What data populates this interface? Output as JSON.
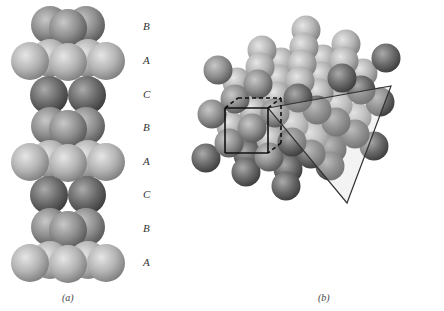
{
  "figure": {
    "panel_a": {
      "caption": "(a)",
      "layer_labels": [
        "B",
        "A",
        "C",
        "B",
        "A",
        "C",
        "B",
        "A"
      ],
      "layer_label_y": [
        27,
        61,
        95,
        128,
        162,
        195,
        229,
        263
      ],
      "label_x": 143
    },
    "panel_b": {
      "caption": "(b)",
      "unit_cell": {
        "front": [
          225,
          108,
          268,
          153
        ],
        "back_offset": [
          13,
          -10
        ]
      },
      "close_packed_plane_triangle": [
        [
          268,
          108
        ],
        [
          391,
          86
        ],
        [
          347,
          203
        ]
      ]
    },
    "colors": {
      "sphere_light": "#d4d4d4",
      "sphere_mid": "#9a9a9a",
      "sphere_dark": "#5a5a5a",
      "line": "#333333",
      "triangle_fill": "rgba(220,220,220,0.35)"
    }
  }
}
